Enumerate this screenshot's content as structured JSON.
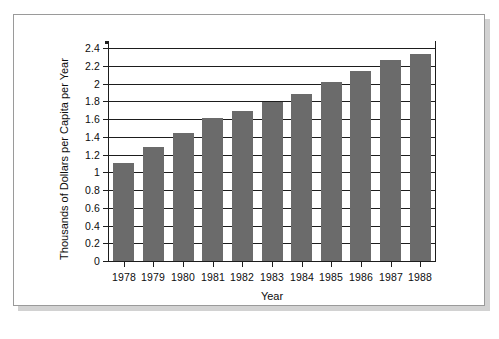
{
  "chart_data": {
    "type": "bar",
    "title": "",
    "subtitle": "",
    "xlabel": "Year",
    "ylabel": "Thousands of Dollars per Capita per Year",
    "categories": [
      "1978",
      "1979",
      "1980",
      "1981",
      "1982",
      "1983",
      "1984",
      "1985",
      "1986",
      "1987",
      "1988"
    ],
    "values": [
      1.1,
      1.28,
      1.44,
      1.61,
      1.69,
      1.79,
      1.88,
      2.02,
      2.14,
      2.26,
      2.33
    ],
    "series": [
      {
        "name": "",
        "values": [
          1.1,
          1.28,
          1.44,
          1.61,
          1.69,
          1.79,
          1.88,
          2.02,
          2.14,
          2.26,
          2.33
        ]
      }
    ],
    "ylim": [
      0,
      2.4
    ],
    "yticks": [
      "0",
      "0.2",
      "0.4",
      "0.6",
      "0.8",
      "1",
      "1.2",
      "1.4",
      "1.6",
      "1.8",
      "2",
      "2.2",
      "2.4"
    ],
    "ytick_values": [
      0,
      0.2,
      0.4,
      0.6,
      0.8,
      1,
      1.2,
      1.4,
      1.6,
      1.8,
      2,
      2.2,
      2.4
    ],
    "grid": true,
    "grid_axis": "y",
    "legend": false,
    "legend_position": "none",
    "bar_color": "#6b6b6b",
    "axis_color": "#1d1d1d",
    "background_color": "#ffffff",
    "annotations": []
  }
}
